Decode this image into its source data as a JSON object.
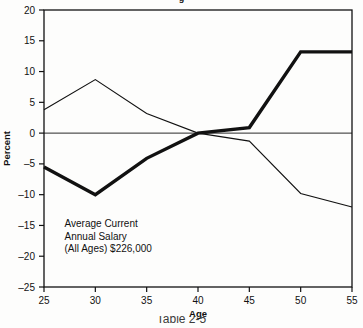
{
  "page": {
    "title_fragment": "g",
    "caption_fragment": "Table 2-5"
  },
  "chart_data": {
    "type": "line",
    "title": "",
    "xlabel": "Age",
    "ylabel": "Percent",
    "x": [
      25,
      30,
      35,
      40,
      45,
      50,
      55
    ],
    "xlim": [
      25,
      55
    ],
    "ylim": [
      -25,
      20
    ],
    "xticks": [
      "25",
      "30",
      "35",
      "40",
      "45",
      "50",
      "55"
    ],
    "yticks": [
      "20",
      "15",
      "10",
      "5",
      "0",
      "-5",
      "-10",
      "-15",
      "-20",
      "-25"
    ],
    "ytick_values": [
      20,
      15,
      10,
      5,
      0,
      -5,
      -10,
      -15,
      -20,
      -25
    ],
    "grid": false,
    "legend": "none",
    "zero_line": 0,
    "series": [
      {
        "name": "thick-series",
        "style": "thick",
        "color": "#111111",
        "width": 3.4,
        "values": [
          -5.5,
          -10.0,
          -4.1,
          0.0,
          0.9,
          13.2,
          13.2
        ]
      },
      {
        "name": "thin-series",
        "style": "thin",
        "color": "#111111",
        "width": 1.1,
        "values": [
          3.8,
          8.7,
          3.2,
          0.0,
          -1.3,
          -9.8,
          -12.0
        ]
      }
    ],
    "annotations": [
      {
        "name": "average-salary-note",
        "lines": [
          "Average Current",
          "Annual Salary",
          "(All Ages) $226,000"
        ],
        "x": 27.0,
        "y": -15.3
      }
    ]
  }
}
